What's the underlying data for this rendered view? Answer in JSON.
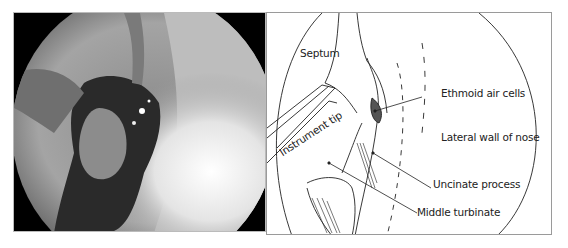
{
  "figure": {
    "left_panel": {
      "type": "endoscopic-photograph",
      "description": "Endoscopic view of nasal cavity"
    },
    "right_panel": {
      "type": "line-drawing",
      "labels": {
        "septum": "Septum",
        "instrument_tip": "Instrument tip",
        "ethmoid_air_cells": "Ethmoid air cells",
        "lateral_wall": "Lateral wall of nose",
        "uncinate_process": "Uncinate process",
        "middle_turbinate": "Middle turbinate"
      }
    }
  }
}
